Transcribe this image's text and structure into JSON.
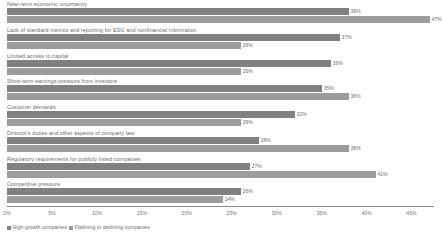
{
  "chart_data": {
    "type": "bar",
    "orientation": "horizontal",
    "title": "",
    "xlabel": "",
    "ylabel": "",
    "xlim": [
      0,
      47.5
    ],
    "grid": false,
    "legend_position": "bottom-left",
    "tick_labels": [
      "0%",
      "5%",
      "10%",
      "15%",
      "20%",
      "25%",
      "30%",
      "35%",
      "40%",
      "45%"
    ],
    "tick_values": [
      0,
      5,
      10,
      15,
      20,
      25,
      30,
      35,
      40,
      45
    ],
    "categories": [
      "Near-term economic uncertainty",
      "Lack of standard metrics and reporting for ESG and nonfinancial information",
      "Limited access to capital",
      "Short-term earnings pressure from investors",
      "Customer demands",
      "Director's duties and other aspects of company law",
      "Regulatory requirements for publicly listed companies",
      "Competitive pressure"
    ],
    "series": [
      {
        "name": "High-growth companies",
        "color": "#808080",
        "values": [
          38,
          37,
          36,
          35,
          32,
          28,
          27,
          26
        ],
        "labels": [
          "38%",
          "37%",
          "36%",
          "35%",
          "32%",
          "28%",
          "27%",
          "26%"
        ]
      },
      {
        "name": "Flatlining or declining companies",
        "color": "#9c9c9c",
        "values": [
          47,
          26,
          26,
          38,
          26,
          38,
          41,
          24
        ],
        "labels": [
          "47%",
          "26%",
          "26%",
          "38%",
          "26%",
          "38%",
          "41%",
          "24%"
        ]
      }
    ]
  }
}
